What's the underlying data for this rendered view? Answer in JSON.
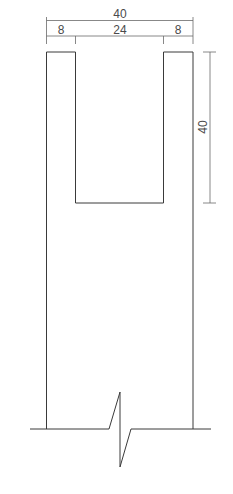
{
  "drawing": {
    "title": "Wall section with notch (broken view)",
    "dimensions": {
      "overall_width": "40",
      "left_leg": "8",
      "notch_width": "24",
      "right_leg": "8",
      "notch_depth": "40"
    },
    "stroke_color": "#3a3a3a",
    "dimension_color": "#6a6a6a"
  }
}
